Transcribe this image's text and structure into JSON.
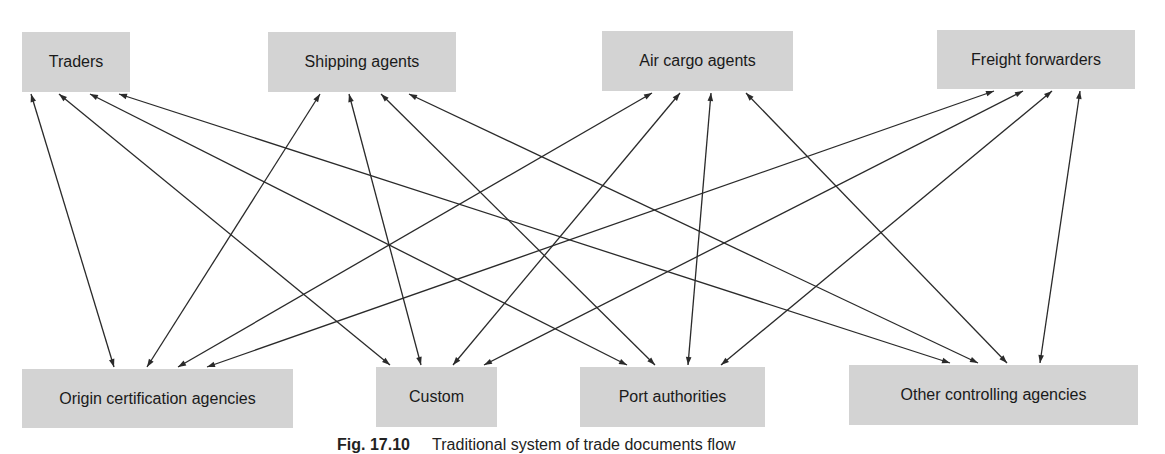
{
  "diagram": {
    "top_nodes": [
      {
        "id": "traders",
        "label": "Traders",
        "x": 22,
        "y": 32,
        "w": 108,
        "h": 60
      },
      {
        "id": "shipping",
        "label": "Shipping agents",
        "x": 268,
        "y": 32,
        "w": 188,
        "h": 60
      },
      {
        "id": "aircargo",
        "label": "Air cargo agents",
        "x": 602,
        "y": 31,
        "w": 191,
        "h": 60
      },
      {
        "id": "freight",
        "label": "Freight forwarders",
        "x": 937,
        "y": 30,
        "w": 198,
        "h": 59
      }
    ],
    "bottom_nodes": [
      {
        "id": "origin",
        "label": "Origin certification agencies",
        "x": 22,
        "y": 369,
        "w": 271,
        "h": 59
      },
      {
        "id": "custom",
        "label": "Custom",
        "x": 376,
        "y": 367,
        "w": 121,
        "h": 60
      },
      {
        "id": "port",
        "label": "Port authorities",
        "x": 580,
        "y": 367,
        "w": 185,
        "h": 60
      },
      {
        "id": "other",
        "label": "Other controlling agencies",
        "x": 849,
        "y": 365,
        "w": 289,
        "h": 60
      }
    ],
    "edges": [
      {
        "from": "traders",
        "to": "origin",
        "x1": 31,
        "y1": 94,
        "x2": 114,
        "y2": 367
      },
      {
        "from": "traders",
        "to": "custom",
        "x1": 59,
        "y1": 94,
        "x2": 390,
        "y2": 365
      },
      {
        "from": "traders",
        "to": "port",
        "x1": 90,
        "y1": 94,
        "x2": 627,
        "y2": 365
      },
      {
        "from": "traders",
        "to": "other",
        "x1": 119,
        "y1": 94,
        "x2": 950,
        "y2": 363
      },
      {
        "from": "shipping",
        "to": "origin",
        "x1": 320,
        "y1": 94,
        "x2": 147,
        "y2": 367
      },
      {
        "from": "shipping",
        "to": "custom",
        "x1": 349,
        "y1": 94,
        "x2": 421,
        "y2": 365
      },
      {
        "from": "shipping",
        "to": "port",
        "x1": 381,
        "y1": 94,
        "x2": 655,
        "y2": 365
      },
      {
        "from": "shipping",
        "to": "other",
        "x1": 409,
        "y1": 94,
        "x2": 978,
        "y2": 363
      },
      {
        "from": "aircargo",
        "to": "origin",
        "x1": 652,
        "y1": 93,
        "x2": 178,
        "y2": 367
      },
      {
        "from": "aircargo",
        "to": "custom",
        "x1": 680,
        "y1": 93,
        "x2": 453,
        "y2": 365
      },
      {
        "from": "aircargo",
        "to": "port",
        "x1": 711,
        "y1": 93,
        "x2": 688,
        "y2": 365
      },
      {
        "from": "aircargo",
        "to": "other",
        "x1": 746,
        "y1": 93,
        "x2": 1007,
        "y2": 363
      },
      {
        "from": "freight",
        "to": "origin",
        "x1": 994,
        "y1": 91,
        "x2": 207,
        "y2": 367
      },
      {
        "from": "freight",
        "to": "custom",
        "x1": 1023,
        "y1": 91,
        "x2": 484,
        "y2": 365
      },
      {
        "from": "freight",
        "to": "port",
        "x1": 1052,
        "y1": 91,
        "x2": 721,
        "y2": 365
      },
      {
        "from": "freight",
        "to": "other",
        "x1": 1080,
        "y1": 91,
        "x2": 1040,
        "y2": 363
      }
    ],
    "colors": {
      "node_fill": "#d3d3d3",
      "edge": "#2a2a2a",
      "text": "#1a1a1a"
    }
  },
  "caption": {
    "fig_label": "Fig. 17.10",
    "text": "Traditional system of trade documents flow"
  }
}
